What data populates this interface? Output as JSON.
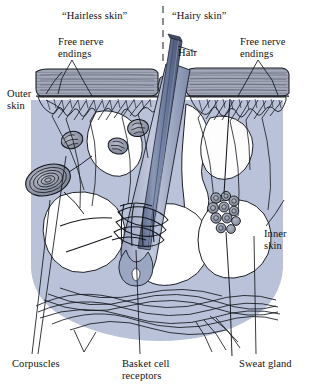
{
  "figure": {
    "width": 314,
    "height": 389,
    "background_color": "#ffffff"
  },
  "colors": {
    "ink": "#111111",
    "dermis_fill": "#b9c2d8",
    "dermis_fill_light": "#c7cee0",
    "hair_shaft": "#6b7a9e",
    "hair_shaft_dark": "#4f5d80",
    "epidermis_band": "#aab3c9",
    "corpuscle_fill": "#8f95a8",
    "gland_fill": "#7e8599",
    "paper": "#ffffff"
  },
  "regions": {
    "divider": {
      "name": "region-divider",
      "style": "dashed-vertical",
      "x": 163
    },
    "left": {
      "label": "“Hairless skin”"
    },
    "right": {
      "label": "“Hairy skin”"
    }
  },
  "labels": {
    "hairless_skin": "“Hairless skin”",
    "hairy_skin": "“Hairy skin”",
    "free_nerve_endings_left": "Free nerve\nendings",
    "free_nerve_endings_right": "Free nerve\nendings",
    "hair": "Hair",
    "outer_skin": "Outer\nskin",
    "inner_skin": "Inner\nskin",
    "corpuscles": "Corpuscles",
    "basket_cell_receptors": "Basket cell\nreceptors",
    "sweat_gland": "Sweat gland"
  },
  "structures": [
    {
      "name": "epidermis",
      "label_ref": "outer_skin",
      "description": "Striated horizontal outer skin band",
      "region": "both"
    },
    {
      "name": "dermis",
      "label_ref": "inner_skin",
      "description": "Blue-gray inner skin body",
      "region": "both"
    },
    {
      "name": "free-nerve-endings-left",
      "label_ref": "free_nerve_endings_left",
      "description": "Branching unmyelinated fibers ending in epidermis",
      "region": "left"
    },
    {
      "name": "free-nerve-endings-right",
      "label_ref": "free_nerve_endings_right",
      "description": "Branching unmyelinated fibers ending in epidermis",
      "region": "right"
    },
    {
      "name": "hair-shaft",
      "label_ref": "hair",
      "description": "Hair shaft emerging at an angle through the epidermis",
      "region": "right"
    },
    {
      "name": "pacinian-corpuscle",
      "label_ref": "corpuscles",
      "description": "Large concentric lamellated corpuscle in deep dermis",
      "region": "left",
      "count": 1
    },
    {
      "name": "encapsulated-corpuscles",
      "label_ref": "corpuscles",
      "description": "Small encapsulated corpuscles in upper dermis",
      "region": "left",
      "count": 3
    },
    {
      "name": "basket-cell-receptors",
      "label_ref": "basket_cell_receptors",
      "description": "Nerve fibers coiled in bands around the hair follicle",
      "region": "right"
    },
    {
      "name": "sweat-gland",
      "label_ref": "sweat_gland",
      "description": "Coiled tubular gland with duct rising to the surface",
      "region": "right"
    },
    {
      "name": "deep-nerve-plexus",
      "description": "Braided bundle of nerve fibers along the base of the dermis",
      "region": "both"
    }
  ]
}
